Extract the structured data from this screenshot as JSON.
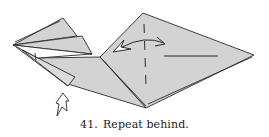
{
  "figure": {
    "step_number": "41.",
    "caption": "Repeat behind.",
    "colors": {
      "paper": "#d3d3d3",
      "paper_light": "#e2e2e2",
      "line": "#2b2b2b",
      "background": "#ffffff"
    },
    "symbols": [
      {
        "name": "valley-fold-dashed-line",
        "meaning": "fold line"
      },
      {
        "name": "swing-arrow",
        "meaning": "fold over and back"
      },
      {
        "name": "hollow-push-arrow",
        "meaning": "push / sink"
      }
    ]
  }
}
